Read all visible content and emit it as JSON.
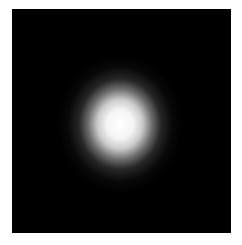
{
  "image": {
    "description": "Soft white glowing spot centered on a black square background",
    "colors": {
      "page_background": "#ffffff",
      "frame_background": "#000000",
      "glow_core": "#ffffff"
    }
  }
}
